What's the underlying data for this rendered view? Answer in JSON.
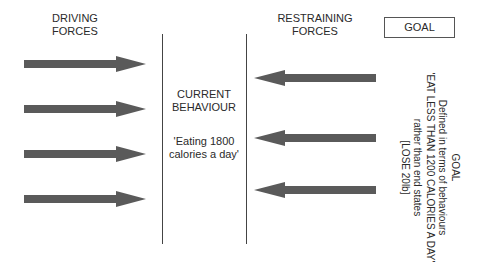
{
  "diagram": {
    "type": "force-field-analysis",
    "driving": {
      "title": "DRIVING FORCES",
      "arrow_count": 4,
      "direction": "right"
    },
    "restraining": {
      "title": "RESTRAINING FORCES",
      "arrow_count": 3,
      "direction": "left"
    },
    "current": {
      "title": "CURRENT BEHAVIOUR",
      "value": "'Eating 1800 calories a day'"
    },
    "goal_box": {
      "label": "GOAL"
    },
    "goal_detail": {
      "lines": [
        "GOAL",
        "Defined in terms of behaviours",
        "'EAT LESS THAN 1200 CALORIES A DAY'",
        "rather than end states",
        "[LOSE 20lb]"
      ]
    },
    "colors": {
      "arrow_fill": "#5a5a5a",
      "line": "#444444",
      "text": "#2a2a2a",
      "background": "#ffffff"
    }
  }
}
